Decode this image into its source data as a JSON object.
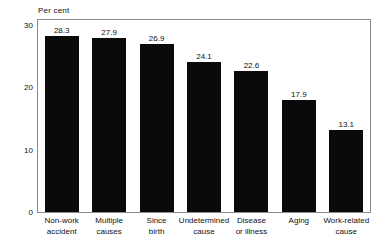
{
  "chart_data": {
    "type": "bar",
    "title": "",
    "subtitle": "",
    "xlabel": "",
    "ylabel": "Per cent",
    "ylim": [
      0,
      30
    ],
    "yticks": [
      0,
      10,
      20,
      30
    ],
    "ytick_labels": [
      "0",
      "10",
      "20",
      "30"
    ],
    "grid": false,
    "legend": "none",
    "orientation": "vertical",
    "bar_color": "#0a0a0a",
    "frame_color": "#8a8a8a",
    "categories": [
      "Non-work accident",
      "Multiple causes",
      "Since birth",
      "Undetermined cause",
      "Disease or illness",
      "Aging",
      "Work-related cause"
    ],
    "category_lines": [
      [
        "Non-work",
        "accident"
      ],
      [
        "Multiple",
        "causes"
      ],
      [
        "Since",
        "birth"
      ],
      [
        "Undetermined",
        "cause"
      ],
      [
        "Disease",
        "or illness"
      ],
      [
        "Aging",
        ""
      ],
      [
        "Work-related",
        "cause"
      ]
    ],
    "values": [
      28.3,
      27.9,
      26.9,
      24.1,
      22.6,
      17.9,
      13.1
    ],
    "value_labels": [
      "28.3",
      "27.9",
      "26.9",
      "24.1",
      "22.6",
      "17.9",
      "13.1"
    ]
  }
}
